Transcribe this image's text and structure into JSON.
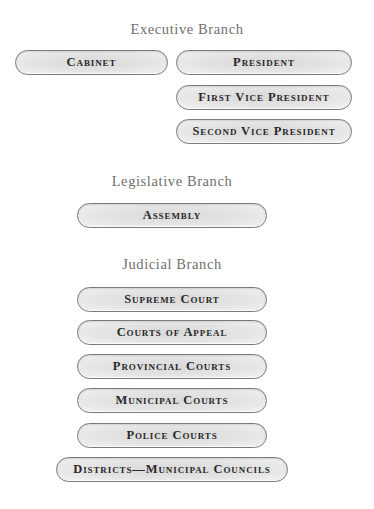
{
  "executive": {
    "heading": "Executive Branch",
    "cabinet": "Cabinet",
    "president": "President",
    "first_vp": "First Vice President",
    "second_vp": "Second Vice President"
  },
  "legislative": {
    "heading": "Legislative Branch",
    "assembly": "Assembly"
  },
  "judicial": {
    "heading": "Judicial Branch",
    "items": [
      "Supreme Court",
      "Courts of Appeal",
      "Provincial Courts",
      "Municipal Courts",
      "Police Courts",
      "Districts—Municipal Councils"
    ]
  },
  "colors": {
    "heading_text": "#6f6f6f",
    "pill_text": "#2a2a2a",
    "pill_border": "#7a7a7a",
    "pill_fill": "#e0e0e0"
  }
}
